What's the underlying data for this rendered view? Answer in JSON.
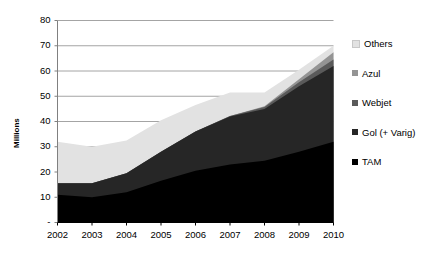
{
  "chart_data": {
    "type": "area",
    "stacked": true,
    "title": "",
    "xlabel": "",
    "ylabel": "Millions",
    "categories": [
      "2002",
      "2003",
      "2004",
      "2005",
      "2006",
      "2007",
      "2008",
      "2009",
      "2010"
    ],
    "x": [
      2002,
      2003,
      2004,
      2005,
      2006,
      2007,
      2008,
      2009,
      2010
    ],
    "ylim": [
      0,
      80
    ],
    "yticks": [
      0,
      10,
      20,
      30,
      40,
      50,
      60,
      70,
      80
    ],
    "ytick_labels": [
      "-",
      "10",
      "20",
      "30",
      "40",
      "50",
      "60",
      "70",
      "80"
    ],
    "grid": true,
    "legend_position": "right",
    "series": [
      {
        "name": "TAM",
        "color": "#000000",
        "values": [
          11.0,
          10.0,
          12.0,
          16.5,
          20.5,
          23.0,
          24.5,
          28.0,
          32.0
        ]
      },
      {
        "name": "Gol (+ Varig)",
        "color": "#262626",
        "values": [
          4.5,
          5.5,
          7.5,
          11.5,
          15.5,
          19.0,
          20.5,
          26.0,
          30.0
        ]
      },
      {
        "name": "Webjet",
        "color": "#5a5a5a",
        "values": [
          0.0,
          0.0,
          0.0,
          0.0,
          0.0,
          0.2,
          0.7,
          1.5,
          2.6
        ]
      },
      {
        "name": "Azul",
        "color": "#949494",
        "values": [
          0.0,
          0.0,
          0.0,
          0.0,
          0.0,
          0.0,
          0.3,
          1.2,
          2.8
        ]
      },
      {
        "name": "Others",
        "color": "#e2e2e2",
        "values": [
          16.5,
          14.5,
          13.0,
          12.5,
          10.5,
          9.3,
          5.5,
          3.8,
          2.6
        ]
      }
    ],
    "totals": [
      32.0,
      30.0,
      32.5,
      40.5,
      46.5,
      51.5,
      51.5,
      60.5,
      70.0
    ]
  },
  "legend": {
    "items": [
      {
        "label": "Others",
        "color": "#e2e2e2"
      },
      {
        "label": "Azul",
        "color": "#949494"
      },
      {
        "label": "Webjet",
        "color": "#5a5a5a"
      },
      {
        "label": "Gol (+ Varig)",
        "color": "#262626"
      },
      {
        "label": "TAM",
        "color": "#000000"
      }
    ]
  },
  "axes": {
    "y_title": "Millions",
    "y_labels": [
      "80",
      "70",
      "60",
      "50",
      "40",
      "30",
      "20",
      "10",
      "-"
    ],
    "x_labels": [
      "2002",
      "2003",
      "2004",
      "2005",
      "2006",
      "2007",
      "2008",
      "2009",
      "2010"
    ]
  },
  "colors": {
    "gridline": "#9a9a9a",
    "axis": "#808080",
    "background": "#ffffff",
    "text": "#000000"
  }
}
